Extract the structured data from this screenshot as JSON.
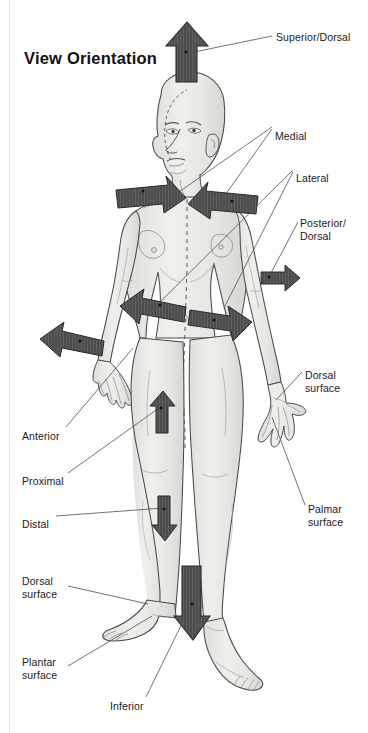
{
  "figure": {
    "title": "View Orientation",
    "background_color": "#ffffff",
    "body_fill": "#e9e9e7",
    "body_outline": "#4a4a4a",
    "arrow_fill": "#4d4d4d",
    "arrow_outline": "#2b2b2b",
    "leader_color": "#5a5a5a",
    "text_color": "#1b1b1b"
  },
  "labels": [
    {
      "id": "superior-dorsal",
      "text": "Superior/Dorsal",
      "x": 276,
      "y": 31,
      "align": "left"
    },
    {
      "id": "medial",
      "text": "Medial",
      "x": 275,
      "y": 130,
      "align": "left"
    },
    {
      "id": "lateral",
      "text": "Lateral",
      "x": 296,
      "y": 172,
      "align": "left"
    },
    {
      "id": "posterior-dorsal",
      "text": "Posterior/",
      "x": 300,
      "y": 217,
      "align": "left"
    },
    {
      "id": "posterior-dorsal-2",
      "text": "Dorsal",
      "x": 300,
      "y": 230,
      "align": "left"
    },
    {
      "id": "dorsal-surface-hand",
      "text": "Dorsal",
      "x": 305,
      "y": 369,
      "align": "left"
    },
    {
      "id": "dorsal-surface-hand-2",
      "text": "surface",
      "x": 305,
      "y": 382,
      "align": "left"
    },
    {
      "id": "palmar-surface",
      "text": "Palmar",
      "x": 308,
      "y": 503,
      "align": "left"
    },
    {
      "id": "palmar-surface-2",
      "text": "surface",
      "x": 308,
      "y": 516,
      "align": "left"
    },
    {
      "id": "anterior",
      "text": "Anterior",
      "x": 22,
      "y": 430,
      "align": "left"
    },
    {
      "id": "proximal",
      "text": "Proximal",
      "x": 22,
      "y": 475,
      "align": "left"
    },
    {
      "id": "distal",
      "text": "Distal",
      "x": 22,
      "y": 518,
      "align": "left"
    },
    {
      "id": "dorsal-surface-foot",
      "text": "Dorsal",
      "x": 22,
      "y": 575,
      "align": "left"
    },
    {
      "id": "dorsal-surface-foot-2",
      "text": "surface",
      "x": 22,
      "y": 588,
      "align": "left"
    },
    {
      "id": "plantar-surface",
      "text": "Plantar",
      "x": 22,
      "y": 656,
      "align": "left"
    },
    {
      "id": "plantar-surface-2",
      "text": "surface",
      "x": 22,
      "y": 669,
      "align": "left"
    },
    {
      "id": "inferior",
      "text": "Inferior",
      "x": 110,
      "y": 700,
      "align": "left"
    }
  ],
  "arrows": [
    {
      "id": "superior-arrow",
      "direction": "up",
      "meaning": "Superior/Dorsal"
    },
    {
      "id": "medial-left-arrow",
      "direction": "right-down",
      "meaning": "Medial"
    },
    {
      "id": "medial-right-arrow",
      "direction": "left-down",
      "meaning": "Medial"
    },
    {
      "id": "lateral-left-arrow",
      "direction": "left",
      "meaning": "Lateral"
    },
    {
      "id": "lateral-right-arrow",
      "direction": "right",
      "meaning": "Lateral"
    },
    {
      "id": "posterior-arrow",
      "direction": "right",
      "meaning": "Posterior/Dorsal"
    },
    {
      "id": "anterior-arrow",
      "direction": "left",
      "meaning": "Anterior"
    },
    {
      "id": "proximal-arrow",
      "direction": "up",
      "meaning": "Proximal"
    },
    {
      "id": "distal-arrow",
      "direction": "down",
      "meaning": "Distal"
    },
    {
      "id": "inferior-arrow",
      "direction": "down",
      "meaning": "Inferior"
    }
  ]
}
